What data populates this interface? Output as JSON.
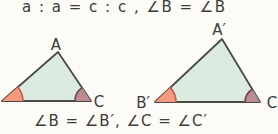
{
  "formulas": {
    "top": "a : a = c : c , ∠B = ∠B",
    "bottom": "∠B = ∠B′, ∠C = ∠C′"
  },
  "labels": {
    "A": "A",
    "C_left": "C",
    "A_prime": "A′",
    "B_prime": "B′",
    "C_right": "C"
  },
  "colors": {
    "background": "#fcfbf7",
    "text": "#3d3c38",
    "triangle_fill": "#dcebdf",
    "triangle_edge": "#4b4a46",
    "angle_B_fill": "#f29a7d",
    "angle_B_arc": "#d4553c",
    "angle_C_fill": "#bb8b90",
    "angle_C_arc": "#64494b"
  }
}
